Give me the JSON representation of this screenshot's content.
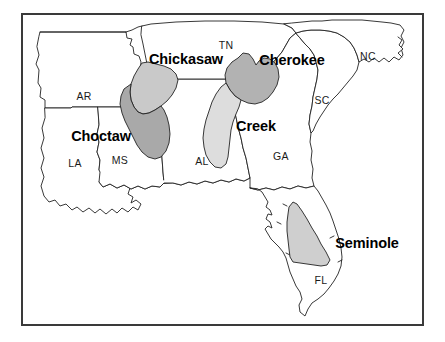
{
  "figure": {
    "background_color": "#ffffff",
    "frame": {
      "border_color": "#3a3a3a",
      "border_width_px": 2,
      "x": 21,
      "y": 13,
      "width": 403,
      "height": 313
    },
    "state_outline_color": "#222222",
    "state_fill_color": "#ffffff"
  },
  "state_labels": [
    {
      "id": "AR",
      "text": "AR",
      "x": 84,
      "y": 96
    },
    {
      "id": "LA",
      "text": "LA",
      "x": 75,
      "y": 163
    },
    {
      "id": "MS",
      "text": "MS",
      "x": 120,
      "y": 160
    },
    {
      "id": "AL",
      "text": "AL",
      "x": 202,
      "y": 161
    },
    {
      "id": "TN",
      "text": "TN",
      "x": 226,
      "y": 45
    },
    {
      "id": "GA",
      "text": "GA",
      "x": 281,
      "y": 156
    },
    {
      "id": "SC",
      "text": "SC",
      "x": 322,
      "y": 100
    },
    {
      "id": "NC",
      "text": "NC",
      "x": 368,
      "y": 56
    },
    {
      "id": "FL",
      "text": "FL",
      "x": 321,
      "y": 280
    }
  ],
  "tribe_regions": [
    {
      "id": "chickasaw",
      "name": "Chickasaw",
      "fill_color": "#c9c9c9",
      "label_x": 186,
      "label_y": 59
    },
    {
      "id": "choctaw",
      "name": "Choctaw",
      "fill_color": "#a9a9a9",
      "label_x": 101,
      "label_y": 136
    },
    {
      "id": "cherokee",
      "name": "Cherokee",
      "fill_color": "#b2b2b2",
      "label_x": 292,
      "label_y": 60
    },
    {
      "id": "creek",
      "name": "Creek",
      "fill_color": "#dddddd",
      "label_x": 256,
      "label_y": 126
    },
    {
      "id": "seminole",
      "name": "Seminole",
      "fill_color": "#cfcfcf",
      "label_x": 367,
      "label_y": 243
    }
  ]
}
